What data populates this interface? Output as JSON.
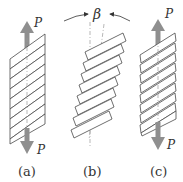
{
  "figure": {
    "panels": [
      {
        "id": "a",
        "label": "(a)",
        "force_top": "P",
        "force_bottom": "P",
        "strip_count": 9
      },
      {
        "id": "b",
        "label": "(b)",
        "angle_symbol": "β",
        "strip_count": 8
      },
      {
        "id": "c",
        "label": "(c)",
        "force_top": "P",
        "force_bottom": "P",
        "strip_count": 9
      }
    ],
    "colors": {
      "arrow": "#8f8f8f",
      "outline": "#4a4a4a",
      "text": "#333333"
    }
  }
}
